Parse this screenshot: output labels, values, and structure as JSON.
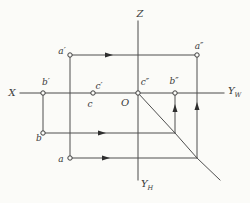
{
  "diagram": {
    "width": 250,
    "height": 203,
    "background": "#fbfbf8",
    "line_color": "#4f4f4f",
    "text_color": "#3a3a3a",
    "axis_lines": [
      {
        "name": "x-yw-axis-line",
        "x1": 20,
        "y1": 93,
        "x2": 224,
        "y2": 93
      },
      {
        "name": "z-yh-axis-line",
        "x1": 138,
        "y1": 21,
        "x2": 138,
        "y2": 180
      }
    ],
    "axis_labels": [
      {
        "name": "z-axis-label",
        "text": "Z",
        "sub": "",
        "x": 140,
        "y": 17,
        "anchor": "middle"
      },
      {
        "name": "x-axis-label",
        "text": "X",
        "sub": "",
        "x": 12,
        "y": 96,
        "anchor": "middle"
      },
      {
        "name": "yw-axis-label",
        "text": "Y",
        "sub": "W",
        "x": 228,
        "y": 94,
        "anchor": "start"
      },
      {
        "name": "yh-axis-label",
        "text": "Y",
        "sub": "H",
        "x": 141,
        "y": 187,
        "anchor": "start"
      },
      {
        "name": "origin-label",
        "text": "O",
        "sub": "",
        "x": 125,
        "y": 106,
        "anchor": "middle"
      }
    ],
    "construction_lines": [
      {
        "name": "line-a-prime-to-a-doubleprime",
        "x1": 70,
        "y1": 55,
        "x2": 197,
        "y2": 55
      },
      {
        "name": "line-a-prime-to-a",
        "x1": 70,
        "y1": 55,
        "x2": 70,
        "y2": 158
      },
      {
        "name": "line-b-prime-to-b",
        "x1": 43,
        "y1": 93,
        "x2": 43,
        "y2": 133
      },
      {
        "name": "line-b-to-diagonal",
        "x1": 43,
        "y1": 133,
        "x2": 175,
        "y2": 133
      },
      {
        "name": "line-diagonal-to-b-doubleprime",
        "x1": 175,
        "y1": 133,
        "x2": 175,
        "y2": 93
      },
      {
        "name": "line-a-to-diagonal",
        "x1": 70,
        "y1": 158,
        "x2": 197,
        "y2": 158
      },
      {
        "name": "line-diagonal-to-a-doubleprime",
        "x1": 197,
        "y1": 158,
        "x2": 197,
        "y2": 55
      }
    ],
    "diagonal": {
      "name": "45-degree-transfer-line",
      "path": "M138,93 L175,133 L197,158 L220,180"
    },
    "arrows": [
      {
        "name": "arrow-a-prime-line",
        "x": 113,
        "y": 55,
        "dir": "right"
      },
      {
        "name": "arrow-b-line",
        "x": 106,
        "y": 133,
        "dir": "right"
      },
      {
        "name": "arrow-a-line",
        "x": 110,
        "y": 158,
        "dir": "right"
      },
      {
        "name": "arrow-up-to-b-doubleprime",
        "x": 175,
        "y": 104,
        "dir": "up"
      },
      {
        "name": "arrow-up-to-a-doubleprime",
        "x": 197,
        "y": 102,
        "dir": "up"
      }
    ],
    "markers": [
      {
        "name": "point-a-prime-marker",
        "x": 70,
        "y": 55
      },
      {
        "name": "point-a-doubleprime-marker",
        "x": 197,
        "y": 55
      },
      {
        "name": "point-b-prime-marker",
        "x": 43,
        "y": 93
      },
      {
        "name": "point-b-doubleprime-marker",
        "x": 175,
        "y": 93
      },
      {
        "name": "point-c-and-c-prime-marker",
        "x": 93,
        "y": 93
      },
      {
        "name": "point-c-doubleprime-marker",
        "x": 138,
        "y": 93
      },
      {
        "name": "point-b-marker",
        "x": 43,
        "y": 133
      },
      {
        "name": "point-a-marker",
        "x": 70,
        "y": 158
      }
    ],
    "point_labels": [
      {
        "name": "label-a-prime",
        "text": "a′",
        "x": 62,
        "y": 54,
        "anchor": "middle"
      },
      {
        "name": "label-a-doubleprime",
        "text": "a″",
        "x": 199,
        "y": 49,
        "anchor": "middle"
      },
      {
        "name": "label-b-prime",
        "text": "b′",
        "x": 46,
        "y": 85,
        "anchor": "middle"
      },
      {
        "name": "label-b-doubleprime",
        "text": "b″",
        "x": 174,
        "y": 84,
        "anchor": "middle"
      },
      {
        "name": "label-c-prime",
        "text": "c′",
        "x": 99,
        "y": 89,
        "anchor": "middle"
      },
      {
        "name": "label-c-doubleprime",
        "text": "c″",
        "x": 145,
        "y": 85,
        "anchor": "middle"
      },
      {
        "name": "label-c",
        "text": "c",
        "x": 90,
        "y": 107,
        "anchor": "middle"
      },
      {
        "name": "label-a",
        "text": "a",
        "x": 61,
        "y": 162,
        "anchor": "middle"
      },
      {
        "name": "label-b",
        "text": "b",
        "x": 39,
        "y": 141,
        "anchor": "middle"
      }
    ]
  }
}
